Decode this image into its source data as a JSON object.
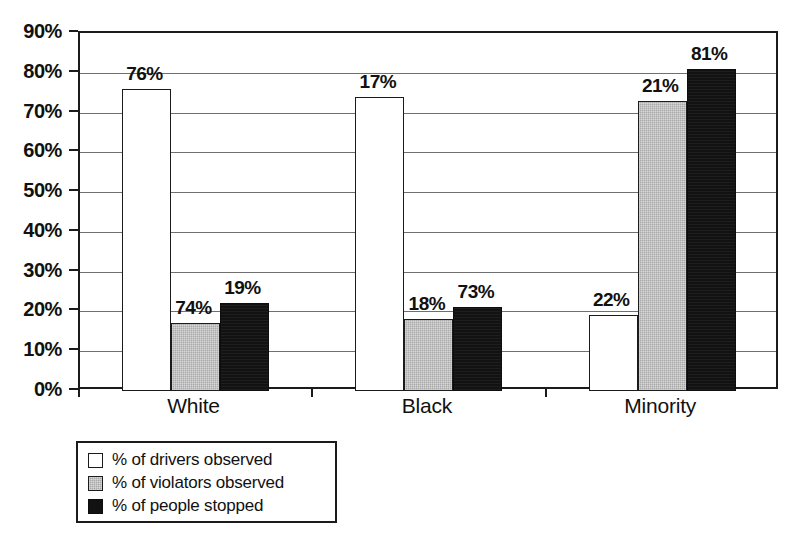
{
  "chart_data": {
    "type": "bar",
    "title": "",
    "subtitle": "",
    "xlabel": "",
    "ylabel": "",
    "categories": [
      "White",
      "Black",
      "Minority"
    ],
    "series": [
      {
        "name": "% of drivers observed",
        "values": [
          76,
          74,
          19
        ]
      },
      {
        "name": "% of violators observed",
        "values": [
          17,
          18,
          73
        ]
      },
      {
        "name": "% of people stopped",
        "values": [
          22,
          21,
          81
        ]
      }
    ],
    "grouped_by_category": {
      "White": {
        "% of drivers observed": 76,
        "% of violators observed": 74,
        "% of people stopped": 19
      },
      "Black": {
        "% of drivers observed": 17,
        "% of violators observed": 18,
        "% of people stopped": 73
      },
      "Minority": {
        "% of drivers observed": 22,
        "% of violators observed": 21,
        "% of people stopped": 81
      }
    },
    "value_labels": {
      "White": [
        "76%",
        "74%",
        "19%"
      ],
      "Black": [
        "17%",
        "18%",
        "73%"
      ],
      "Minority": [
        "22%",
        "21%",
        "81%"
      ]
    },
    "ylim": [
      0,
      90
    ],
    "ytick_values": [
      0,
      10,
      20,
      30,
      40,
      50,
      60,
      70,
      80,
      90
    ],
    "ytick_labels": [
      "0%",
      "10%",
      "20%",
      "30%",
      "40%",
      "50%",
      "60%",
      "70%",
      "80%",
      "90%"
    ],
    "grid": "horizontal",
    "legend_position": "below-left",
    "value_unit": "%"
  },
  "legend": {
    "items": [
      {
        "label": "% of drivers observed",
        "swatch": "white-square",
        "color": "#ffffff"
      },
      {
        "label": "% of violators observed",
        "swatch": "gray-square",
        "color": "#a9a9a9"
      },
      {
        "label": "% of people stopped",
        "swatch": "black-square",
        "color": "#121212"
      }
    ]
  },
  "colors": {
    "series_1": "#ffffff",
    "series_2": "#a9a9a9",
    "series_3": "#121212",
    "axis": "#1b1b1b",
    "gridline": "#6f6f6f",
    "background": "#ffffff",
    "text": "#111111"
  }
}
